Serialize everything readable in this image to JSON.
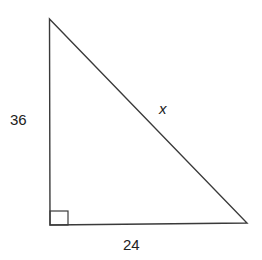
{
  "diagram": {
    "type": "right-triangle",
    "labels": {
      "vertical_leg": "36",
      "horizontal_leg": "24",
      "hypotenuse": "x"
    },
    "right_angle_marker": true,
    "colors": {
      "stroke": "#3a3a3a",
      "text": "#222222",
      "background": "#ffffff"
    }
  }
}
